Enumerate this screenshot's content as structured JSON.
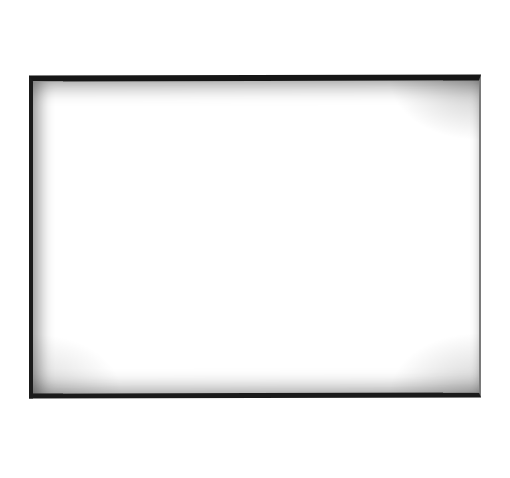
{
  "canvas": {
    "background": "#ffffff",
    "description": "Blank rectangular frame"
  },
  "frame": {
    "border_color": "#161616",
    "fill_color": "#ffffff",
    "content": ""
  }
}
